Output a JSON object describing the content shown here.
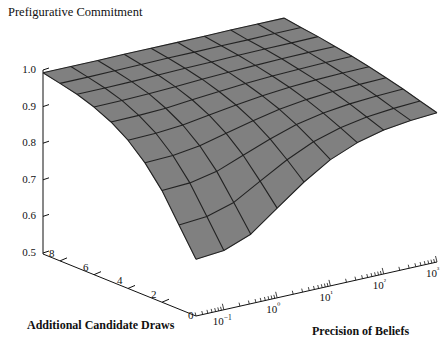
{
  "chart_data": {
    "type": "surface",
    "title": "Prefigurative Commitment",
    "zlabel": "Prefigurative Commitment",
    "xlabel": "Precision of Beliefs",
    "ylabel": "Additional Candidate Draws",
    "zlim": [
      0.5,
      1.0
    ],
    "z_ticks": [
      "1.0",
      "0.9",
      "0.8",
      "0.7",
      "0.6",
      "0.5"
    ],
    "z_tick_values": [
      1.0,
      0.9,
      0.8,
      0.7,
      0.6,
      0.5
    ],
    "y_ticks": [
      "8",
      "6",
      "4",
      "2",
      "0"
    ],
    "y_tick_values": [
      8,
      6,
      4,
      2,
      0
    ],
    "y_range": [
      0,
      9
    ],
    "x_ticks": [
      "10−1",
      "10⁰",
      "10¹",
      "10²",
      "10³"
    ],
    "x_tick_values": [
      0.1,
      1,
      10,
      100,
      1000
    ],
    "x_scale": "log",
    "x_range": [
      0.03,
      1000
    ],
    "grid": true,
    "legend": false,
    "surface_color": "#808080",
    "mesh_color": "#222222",
    "axis_color": "#111111",
    "precision_grid": [
      0.03,
      0.1,
      0.32,
      1,
      3.2,
      10,
      32,
      100,
      320,
      1000
    ],
    "draws_grid": [
      0,
      1,
      2,
      3,
      4,
      5,
      6,
      7,
      8,
      9
    ],
    "z_matrix": [
      [
        0.655,
        0.662,
        0.69,
        0.745,
        0.8,
        0.845,
        0.875,
        0.893,
        0.903,
        0.908
      ],
      [
        0.73,
        0.736,
        0.758,
        0.8,
        0.842,
        0.875,
        0.897,
        0.91,
        0.917,
        0.921
      ],
      [
        0.805,
        0.809,
        0.824,
        0.852,
        0.88,
        0.903,
        0.918,
        0.927,
        0.932,
        0.935
      ],
      [
        0.862,
        0.865,
        0.875,
        0.893,
        0.911,
        0.926,
        0.936,
        0.942,
        0.945,
        0.947
      ],
      [
        0.905,
        0.907,
        0.913,
        0.924,
        0.935,
        0.944,
        0.951,
        0.955,
        0.957,
        0.958
      ],
      [
        0.936,
        0.937,
        0.94,
        0.947,
        0.953,
        0.959,
        0.963,
        0.965,
        0.967,
        0.968
      ],
      [
        0.958,
        0.959,
        0.961,
        0.964,
        0.968,
        0.971,
        0.973,
        0.975,
        0.976,
        0.976
      ],
      [
        0.974,
        0.974,
        0.975,
        0.977,
        0.979,
        0.98,
        0.982,
        0.983,
        0.983,
        0.984
      ],
      [
        0.985,
        0.985,
        0.986,
        0.987,
        0.988,
        0.988,
        0.989,
        0.989,
        0.99,
        0.99
      ],
      [
        0.995,
        0.995,
        0.995,
        0.996,
        0.996,
        0.996,
        0.996,
        0.997,
        0.997,
        0.997
      ]
    ]
  },
  "axes": {
    "z_title": "Prefigurative Commitment",
    "x_title": "Precision of Beliefs",
    "y_title": "Additional Candidate Draws",
    "origin_label": "0"
  }
}
